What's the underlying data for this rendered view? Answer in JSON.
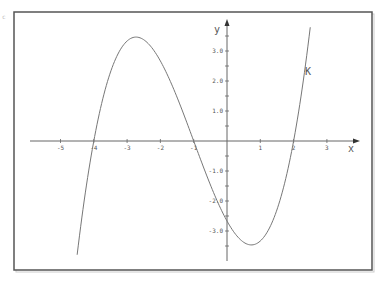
{
  "chart_data": {
    "type": "line",
    "title": "",
    "function": "f(x) = (x+4)(x+1)(x-2)/3",
    "series": [
      {
        "name": "K",
        "x": [
          -4.5,
          -4.0,
          -3.5,
          -3.0,
          -2.732,
          -2.5,
          -2.0,
          -1.5,
          -1.0,
          -0.5,
          0.0,
          0.5,
          0.732,
          1.0,
          1.5,
          2.0,
          2.5
        ],
        "y": [
          -3.79,
          0.0,
          2.29,
          3.33,
          3.46,
          3.38,
          2.67,
          1.46,
          0.0,
          -1.46,
          -2.67,
          -3.38,
          -3.46,
          -3.33,
          -2.29,
          0.0,
          3.79
        ]
      }
    ],
    "xlabel": "x",
    "ylabel": "y",
    "x_ticks": [
      "-5",
      "-4",
      "-3",
      "-2",
      "-1",
      "1",
      "2",
      "3"
    ],
    "y_ticks": [
      "3.0",
      "2.0",
      "1.0",
      "-1.0",
      "-2.0",
      "-3.0"
    ],
    "xlim": [
      -5.9,
      3.9
    ],
    "ylim": [
      -4.0,
      4.0
    ],
    "grid": false,
    "legend": "none",
    "annotations": [
      {
        "text": "K",
        "x": 2.7,
        "y": 2.1
      }
    ],
    "roots": [
      -4,
      -1,
      2
    ],
    "local_max": {
      "x": -2.73,
      "y": 3.46
    },
    "local_min": {
      "x": 0.73,
      "y": -3.46
    },
    "y_intercept": -2.67
  },
  "labels": {
    "x_axis": "x",
    "y_axis": "y",
    "curve": "K",
    "corner": "c"
  },
  "colors": {
    "frame": "#555555",
    "axis": "#666666",
    "curve": "#777777",
    "text": "#555555"
  }
}
